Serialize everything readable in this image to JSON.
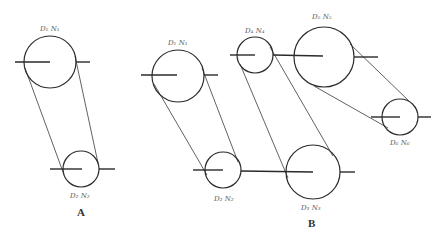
{
  "figure": {
    "colors": {
      "stroke": "#2a2a2a",
      "label": "#555555",
      "background": "#ffffff"
    }
  },
  "groups": [
    {
      "label": "A",
      "pulleys": [
        {
          "id": "A1",
          "label": "D₁ N₁",
          "cx": 50,
          "cy": 62,
          "r": 26
        },
        {
          "id": "A2",
          "label": "D₂ N₂",
          "cx": 81,
          "cy": 169,
          "r": 18
        }
      ]
    },
    {
      "label": "B",
      "pulleys": [
        {
          "id": "B1",
          "label": "D₁ N₁",
          "cx": 178,
          "cy": 76,
          "r": 26
        },
        {
          "id": "B2",
          "label": "D₂ N₂",
          "cx": 223,
          "cy": 170,
          "r": 18
        },
        {
          "id": "B3",
          "label": "D₃ N₃",
          "cx": 313,
          "cy": 172,
          "r": 27
        },
        {
          "id": "B4",
          "label": "D₄ N₄",
          "cx": 255,
          "cy": 55,
          "r": 18
        },
        {
          "id": "B5",
          "label": "D₅ N₅",
          "cx": 324,
          "cy": 57,
          "r": 30
        },
        {
          "id": "B6",
          "label": "D₆ N₆",
          "cx": 400,
          "cy": 117,
          "r": 18
        }
      ]
    }
  ],
  "labels": {
    "A1": "D₁ N₁",
    "A2": "D₂ N₂",
    "B1": "D₁ N₁",
    "B2": "D₂ N₂",
    "B3": "D₃ N₃",
    "B4": "D₄ N₄",
    "B5": "D₅ N₅",
    "B6": "D₆ N₆",
    "groupA": "A",
    "groupB": "B"
  }
}
